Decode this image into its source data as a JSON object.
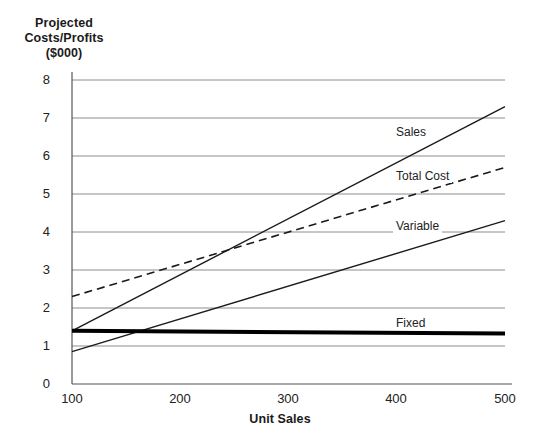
{
  "chart_data": {
    "type": "line",
    "title": "Projected\nCosts/Profits\n($000)",
    "title_lines": [
      "Projected",
      "Costs/Profits",
      "($000)"
    ],
    "xlabel": "Unit Sales",
    "ylabel": "Projected Costs/Profits ($000)",
    "xlim": [
      100,
      500
    ],
    "ylim": [
      0,
      8
    ],
    "xticks": [
      "100",
      "200",
      "300",
      "400",
      "500"
    ],
    "xtick_values": [
      100,
      200,
      300,
      400,
      500
    ],
    "yticks": [
      "0",
      "1",
      "2",
      "3",
      "4",
      "5",
      "6",
      "7",
      "8"
    ],
    "ytick_values": [
      0,
      1,
      2,
      3,
      4,
      5,
      6,
      7,
      8
    ],
    "grid": "horizontal",
    "legend": "inline-labels",
    "series": [
      {
        "name": "Sales",
        "style": "solid",
        "width": 1.4,
        "color": "#1a1a1a",
        "x": [
          100,
          500
        ],
        "values": [
          1.4,
          7.3
        ]
      },
      {
        "name": "Total Cost",
        "style": "dashed",
        "width": 1.6,
        "color": "#1a1a1a",
        "x": [
          100,
          500
        ],
        "values": [
          2.3,
          5.7
        ]
      },
      {
        "name": "Variable",
        "style": "solid",
        "width": 1.4,
        "color": "#1a1a1a",
        "x": [
          100,
          500
        ],
        "values": [
          0.85,
          4.3
        ]
      },
      {
        "name": "Fixed",
        "style": "solid-thick",
        "width": 4,
        "color": "#000000",
        "x": [
          100,
          500
        ],
        "values": [
          1.4,
          1.33
        ]
      }
    ],
    "annotations": [
      {
        "text": "Sales",
        "x": 396,
        "y": 132
      },
      {
        "text": "Total Cost",
        "x": 396,
        "y": 176
      },
      {
        "text": "Variable",
        "x": 396,
        "y": 226
      },
      {
        "text": "Fixed",
        "x": 396,
        "y": 323
      }
    ],
    "colors": {
      "axis": "#555555",
      "grid": "#8c8c8c",
      "line": "#1a1a1a",
      "fixed_line": "#000000",
      "text": "#1a1a1a",
      "background": "#ffffff"
    }
  }
}
